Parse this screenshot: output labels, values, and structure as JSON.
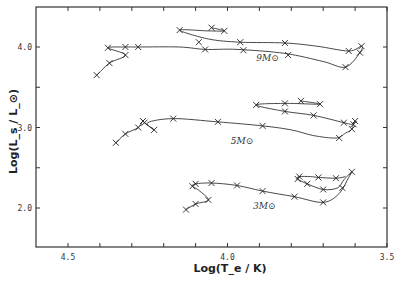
{
  "chart_data": {
    "type": "line",
    "title": "",
    "xlabel": "Log(T_e / K)",
    "ylabel": "Log(L_s / L_⊙)",
    "xlim": [
      4.6,
      3.5
    ],
    "ylim": [
      1.5,
      4.5
    ],
    "x_inverted": true,
    "x_ticks": [
      4.5,
      4.4,
      4.3,
      4.2,
      4.1,
      4.0,
      3.9,
      3.8,
      3.7,
      3.6,
      3.5
    ],
    "x_tick_labels": [
      "4.5",
      "",
      "",
      "",
      "",
      "4.0",
      "",
      "",
      "",
      "",
      "3.5"
    ],
    "y_ticks": [
      2.0,
      2.5,
      3.0,
      3.5,
      4.0
    ],
    "y_tick_labels": [
      "2.0",
      "",
      "3.0",
      "",
      "4.0"
    ],
    "grid": false,
    "legend": "none",
    "marker": "x",
    "annotations": [
      {
        "text": "9M⊙",
        "x": 3.91,
        "y": 3.83
      },
      {
        "text": "5M⊙",
        "x": 3.99,
        "y": 2.8
      },
      {
        "text": "3M⊙",
        "x": 3.92,
        "y": 1.99
      }
    ],
    "series": [
      {
        "name": "9M⊙",
        "points": [
          [
            4.41,
            3.65
          ],
          [
            4.37,
            3.8
          ],
          [
            4.32,
            3.9
          ],
          [
            4.375,
            3.99
          ],
          [
            4.32,
            4.0
          ],
          [
            4.28,
            4.0
          ],
          [
            4.15,
            4.0
          ],
          [
            4.07,
            3.97
          ],
          [
            3.97,
            3.97
          ],
          [
            3.82,
            3.92
          ],
          [
            3.7,
            3.82
          ],
          [
            3.63,
            3.75
          ],
          [
            3.585,
            3.93
          ],
          [
            3.58,
            4.01
          ],
          [
            3.62,
            3.95
          ],
          [
            3.72,
            4.01
          ],
          [
            3.82,
            4.05
          ],
          [
            3.96,
            4.06
          ],
          [
            4.06,
            4.1
          ],
          [
            4.15,
            4.21
          ],
          [
            4.06,
            4.2
          ],
          [
            4.01,
            4.2
          ],
          [
            4.05,
            4.24
          ]
        ],
        "markers": [
          [
            4.41,
            3.65
          ],
          [
            4.37,
            3.8
          ],
          [
            4.32,
            3.9
          ],
          [
            4.375,
            3.99
          ],
          [
            4.32,
            4.0
          ],
          [
            4.28,
            4.0
          ],
          [
            4.07,
            3.97
          ],
          [
            3.96,
            4.06
          ],
          [
            3.82,
            4.05
          ],
          [
            3.62,
            3.95
          ],
          [
            3.58,
            4.01
          ],
          [
            3.585,
            3.93
          ],
          [
            3.63,
            3.75
          ],
          [
            3.81,
            3.9
          ],
          [
            3.95,
            3.96
          ],
          [
            4.09,
            4.06
          ],
          [
            4.15,
            4.21
          ],
          [
            4.05,
            4.24
          ],
          [
            4.01,
            4.2
          ]
        ]
      },
      {
        "name": "5M⊙",
        "points": [
          [
            4.35,
            2.81
          ],
          [
            4.32,
            2.92
          ],
          [
            4.28,
            3.0
          ],
          [
            4.265,
            3.08
          ],
          [
            4.26,
            3.06
          ],
          [
            4.23,
            2.97
          ],
          [
            4.25,
            3.06
          ],
          [
            4.17,
            3.11
          ],
          [
            4.03,
            3.07
          ],
          [
            3.89,
            3.02
          ],
          [
            3.8,
            2.97
          ],
          [
            3.73,
            2.9
          ],
          [
            3.66,
            2.87
          ],
          [
            3.63,
            2.93
          ],
          [
            3.61,
            2.98
          ],
          [
            3.605,
            3.05
          ],
          [
            3.6,
            3.08
          ],
          [
            3.61,
            3.04
          ],
          [
            3.635,
            3.06
          ],
          [
            3.73,
            3.15
          ],
          [
            3.82,
            3.2
          ],
          [
            3.91,
            3.28
          ],
          [
            3.82,
            3.3
          ],
          [
            3.71,
            3.29
          ],
          [
            3.77,
            3.33
          ]
        ],
        "markers": [
          [
            4.35,
            2.81
          ],
          [
            4.32,
            2.92
          ],
          [
            4.28,
            3.0
          ],
          [
            4.265,
            3.08
          ],
          [
            4.26,
            3.06
          ],
          [
            4.23,
            2.97
          ],
          [
            4.17,
            3.11
          ],
          [
            4.03,
            3.07
          ],
          [
            3.89,
            3.02
          ],
          [
            3.65,
            2.87
          ],
          [
            3.61,
            2.98
          ],
          [
            3.6,
            3.08
          ],
          [
            3.605,
            3.04
          ],
          [
            3.635,
            3.06
          ],
          [
            3.73,
            3.15
          ],
          [
            3.82,
            3.2
          ],
          [
            3.91,
            3.28
          ],
          [
            3.82,
            3.3
          ],
          [
            3.77,
            3.33
          ],
          [
            3.71,
            3.29
          ]
        ]
      },
      {
        "name": "3M⊙",
        "points": [
          [
            4.13,
            1.98
          ],
          [
            4.1,
            2.05
          ],
          [
            4.06,
            2.1
          ],
          [
            4.09,
            2.22
          ],
          [
            4.11,
            2.27
          ],
          [
            4.1,
            2.3
          ],
          [
            4.05,
            2.31
          ],
          [
            3.97,
            2.28
          ],
          [
            3.89,
            2.21
          ],
          [
            3.79,
            2.14
          ],
          [
            3.7,
            2.07
          ],
          [
            3.65,
            2.18
          ],
          [
            3.62,
            2.38
          ],
          [
            3.61,
            2.45
          ],
          [
            3.635,
            2.35
          ],
          [
            3.655,
            2.25
          ],
          [
            3.7,
            2.23
          ],
          [
            3.75,
            2.3
          ],
          [
            3.78,
            2.36
          ],
          [
            3.775,
            2.39
          ],
          [
            3.74,
            2.39
          ],
          [
            3.715,
            2.38
          ],
          [
            3.66,
            2.37
          ],
          [
            3.63,
            2.39
          ]
        ],
        "markers": [
          [
            4.13,
            1.98
          ],
          [
            4.1,
            2.05
          ],
          [
            4.06,
            2.1
          ],
          [
            4.11,
            2.27
          ],
          [
            4.1,
            2.3
          ],
          [
            4.05,
            2.31
          ],
          [
            3.97,
            2.28
          ],
          [
            3.89,
            2.21
          ],
          [
            3.79,
            2.14
          ],
          [
            3.7,
            2.07
          ],
          [
            3.61,
            2.45
          ],
          [
            3.64,
            2.25
          ],
          [
            3.7,
            2.23
          ],
          [
            3.75,
            2.3
          ],
          [
            3.78,
            2.36
          ],
          [
            3.775,
            2.39
          ],
          [
            3.715,
            2.38
          ],
          [
            3.66,
            2.37
          ]
        ]
      }
    ]
  }
}
